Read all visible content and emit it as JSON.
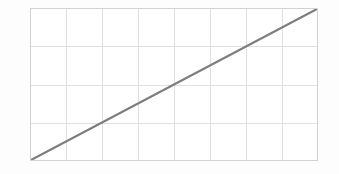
{
  "figure": {
    "title": "",
    "background_color": "#fdfdfd",
    "plot": {
      "left": 30,
      "top": 8,
      "width": 288,
      "height": 153,
      "border_color": "#d2d2d2",
      "grid_color": "#e0e0e0",
      "grid_line_width": 1,
      "plot_background": "#ffffff"
    },
    "line": {
      "color": "#7d7d7d",
      "width": 2,
      "cap": "butt"
    }
  },
  "chart_data": {
    "type": "line",
    "title": "",
    "xlabel": "",
    "ylabel": "",
    "x": [
      0,
      8
    ],
    "xlim": [
      0,
      8
    ],
    "ylim": [
      0,
      4
    ],
    "grid": true,
    "grid_columns": 8,
    "grid_rows": 4,
    "xticks": [
      0,
      1,
      2,
      3,
      4,
      5,
      6,
      7,
      8
    ],
    "yticks": [
      0,
      1,
      2,
      3,
      4
    ],
    "xticklabels": [
      "",
      "",
      "",
      "",
      "",
      "",
      "",
      "",
      ""
    ],
    "yticklabels": [
      "",
      "",
      "",
      "",
      ""
    ],
    "legend": null,
    "legend_position": "none",
    "series": [
      {
        "name": "linear",
        "color": "#7d7d7d",
        "x": [
          0,
          8
        ],
        "values": [
          0,
          4
        ]
      }
    ],
    "annotations": []
  }
}
